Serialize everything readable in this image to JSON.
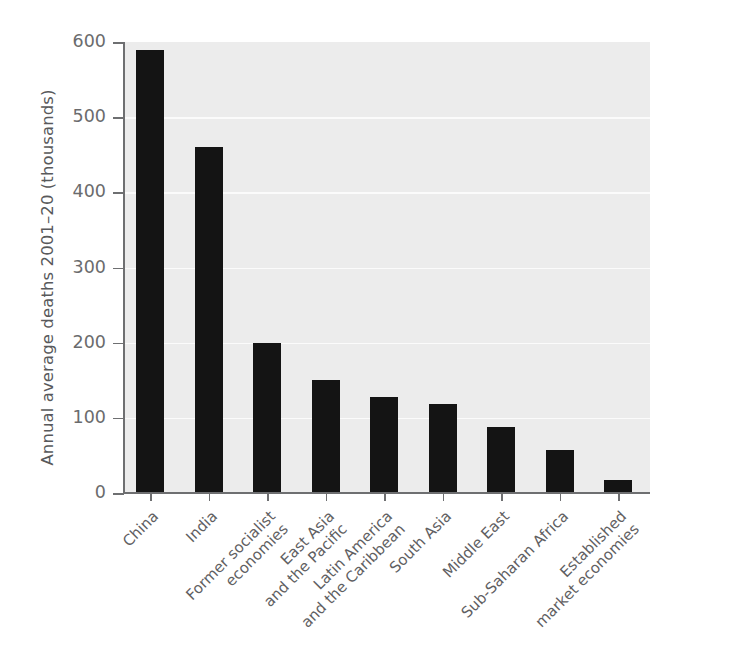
{
  "chart_data": {
    "type": "bar",
    "title": "",
    "xlabel": "",
    "ylabel": "Annual average deaths 2001–20 (thousands)",
    "ylim": [
      0,
      600
    ],
    "yticks": [
      "0",
      "100",
      "200",
      "300",
      "400",
      "500",
      "600"
    ],
    "ytick_values": [
      0,
      100,
      200,
      300,
      400,
      500,
      600
    ],
    "grid": "horizontal",
    "legend": "none",
    "bar_color": "#141414",
    "plot_background": "#ececec",
    "axis_color": "#6e6f71",
    "text_color": "#5f6062",
    "categories": [
      "China",
      "India",
      "Former socialist\neconomies",
      "East Asia\nand the Pacific",
      "Latin America\nand the Caribbean",
      "South Asia",
      "Middle East",
      "Sub-Saharan Africa",
      "Established\nmarket economies"
    ],
    "values": [
      590,
      460,
      200,
      150,
      128,
      118,
      88,
      57,
      17
    ]
  }
}
